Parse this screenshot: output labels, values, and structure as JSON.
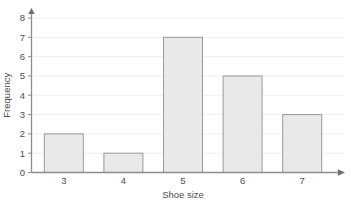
{
  "chart_data": {
    "type": "bar",
    "title": "",
    "subtitle": "",
    "xlabel": "Shoe size",
    "ylabel": "Frequency",
    "categories": [
      "3",
      "4",
      "5",
      "6",
      "7"
    ],
    "values": [
      2,
      1,
      7,
      5,
      3
    ],
    "series": [
      {
        "name": "Frequency",
        "values": [
          2,
          1,
          7,
          5,
          3
        ]
      }
    ],
    "xlim": [
      2.5,
      7.8
    ],
    "ylim": [
      0,
      8
    ],
    "ytick_labels": [
      "0",
      "1",
      "2",
      "3",
      "4",
      "5",
      "6",
      "7",
      "8"
    ],
    "ytick_values": [
      0,
      1,
      2,
      3,
      4,
      5,
      6,
      7,
      8
    ],
    "xtick_labels": [
      "3",
      "4",
      "5",
      "6",
      "7"
    ],
    "grid": true,
    "grid_axis": "y",
    "legend": false,
    "legend_position": "none",
    "bar_fill_color": "#e9e9e9",
    "bar_edge_color": "#9a9a9a",
    "grid_color": "#f0f0f0",
    "axis_color": "#8c8c8c",
    "text_color": "#4d4d4d",
    "background_color": "#ffffff",
    "axis_arrows": true
  }
}
